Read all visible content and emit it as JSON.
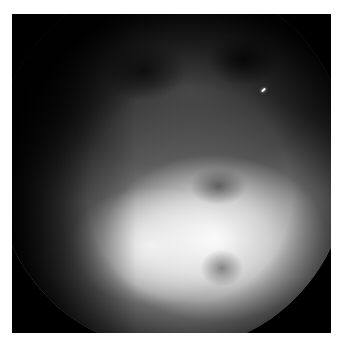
{
  "image": {
    "kind": "endoscopic-grayscale-frame",
    "border_color": "#ffffff",
    "background_color": "#000000",
    "mask_shape": "circle",
    "tones": {
      "shadow": "#161616",
      "midtone": "#7a7a7a",
      "highlight": "#ffffff"
    },
    "specular_highlight": {
      "x": 263,
      "y": 90
    }
  }
}
